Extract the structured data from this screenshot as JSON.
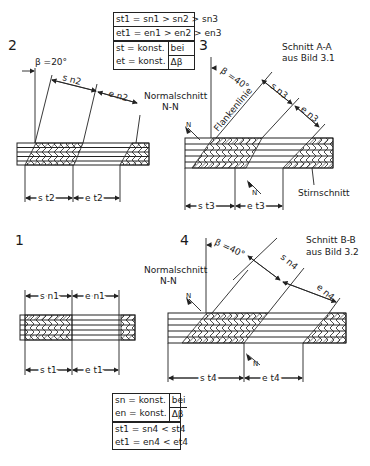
{
  "panels": {
    "p2": {
      "number": "2",
      "beta": "β =20°",
      "s_label": "s n2",
      "e_label": "e n2",
      "st_label": "s t2",
      "et_label": "e t2"
    },
    "p3": {
      "number": "3",
      "beta": "β =40°",
      "title_line1": "Schnitt A-A",
      "title_line2": "aus Bild 3.1",
      "normal_line1": "Normalschnitt",
      "normal_line2": "N-N",
      "flank": "Flankenlinie",
      "s_label": "s n3",
      "e_label": "e n3",
      "st_label": "s t3",
      "et_label": "e t3",
      "stirn": "Stirnschnitt",
      "N": "N"
    },
    "p1": {
      "number": "1",
      "sn_label": "s n1",
      "en_label": "e n1",
      "st_label": "s t1",
      "et_label": "e t1"
    },
    "p4": {
      "number": "4",
      "beta": "β =40°",
      "title_line1": "Schnitt B-B",
      "title_line2": "aus Bild 3.2",
      "normal_line1": "Normalschnitt",
      "normal_line2": "N-N",
      "s_label": "s n4",
      "e_label": "e n4",
      "st_label": "s t4",
      "et_label": "e t4",
      "N": "N"
    }
  },
  "top_box": {
    "line1": "st1 = sn1 > sn2 > sn3",
    "line2": "et1 = en1 > en2 > en3",
    "line3": "st = konst.",
    "line4": "et = konst.",
    "bei": "bei",
    "delta": "Δβ"
  },
  "bottom_box": {
    "line1": "sn = konst.",
    "line2": "en = konst.",
    "bei": "bei",
    "delta": "Δβ",
    "line3": "st1 = sn4 < st4",
    "line4": "et1 = en4 < et4"
  }
}
